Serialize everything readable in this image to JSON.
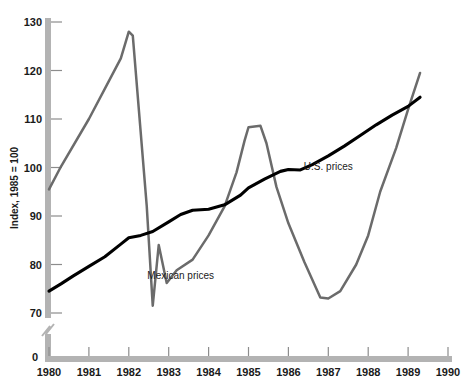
{
  "chart_data": {
    "type": "line",
    "title": "",
    "xlabel": "",
    "ylabel": "Index, 1985 = 100",
    "xlim": [
      1980,
      1990
    ],
    "ylim": [
      70,
      130
    ],
    "yticks": [
      70,
      80,
      90,
      100,
      110,
      120,
      130
    ],
    "xticks": [
      1980,
      1981,
      1982,
      1983,
      1984,
      1985,
      1986,
      1987,
      1988,
      1989,
      1990
    ],
    "origin_label": "0",
    "axis_break": true,
    "grid": false,
    "legend": "inline-annotations",
    "series": [
      {
        "name": "U.S. prices",
        "color": "#000000",
        "label_x": 1987.0,
        "label_y": 99.5,
        "points": [
          [
            1980.0,
            74.5
          ],
          [
            1980.3,
            76.0
          ],
          [
            1980.6,
            77.6
          ],
          [
            1981.0,
            79.6
          ],
          [
            1981.4,
            81.6
          ],
          [
            1981.8,
            84.2
          ],
          [
            1982.0,
            85.5
          ],
          [
            1982.3,
            86.0
          ],
          [
            1982.6,
            86.8
          ],
          [
            1983.0,
            88.8
          ],
          [
            1983.3,
            90.3
          ],
          [
            1983.6,
            91.2
          ],
          [
            1984.0,
            91.4
          ],
          [
            1984.4,
            92.3
          ],
          [
            1984.8,
            94.3
          ],
          [
            1985.0,
            95.8
          ],
          [
            1985.4,
            97.6
          ],
          [
            1985.8,
            99.2
          ],
          [
            1986.0,
            99.6
          ],
          [
            1986.3,
            99.5
          ],
          [
            1986.6,
            100.6
          ],
          [
            1987.0,
            102.4
          ],
          [
            1987.4,
            104.4
          ],
          [
            1987.8,
            106.6
          ],
          [
            1988.2,
            108.8
          ],
          [
            1988.6,
            110.8
          ],
          [
            1989.0,
            112.6
          ],
          [
            1989.3,
            114.5
          ]
        ]
      },
      {
        "name": "Mexican prices",
        "color": "#6b6b6b",
        "label_x": 1983.3,
        "label_y": 77.0,
        "points": [
          [
            1980.0,
            95.5
          ],
          [
            1980.3,
            100.2
          ],
          [
            1981.0,
            110.0
          ],
          [
            1981.5,
            117.8
          ],
          [
            1981.8,
            122.5
          ],
          [
            1982.0,
            128.0
          ],
          [
            1982.1,
            127.2
          ],
          [
            1982.45,
            92.0
          ],
          [
            1982.6,
            71.5
          ],
          [
            1982.75,
            84.0
          ],
          [
            1982.95,
            76.2
          ],
          [
            1983.2,
            78.8
          ],
          [
            1983.6,
            81.0
          ],
          [
            1984.0,
            86.0
          ],
          [
            1984.4,
            92.0
          ],
          [
            1984.7,
            99.0
          ],
          [
            1984.9,
            105.5
          ],
          [
            1985.0,
            108.3
          ],
          [
            1985.3,
            108.6
          ],
          [
            1985.45,
            105.0
          ],
          [
            1985.7,
            96.0
          ],
          [
            1986.0,
            88.5
          ],
          [
            1986.4,
            80.5
          ],
          [
            1986.8,
            73.2
          ],
          [
            1987.0,
            73.0
          ],
          [
            1987.3,
            74.5
          ],
          [
            1987.7,
            80.0
          ],
          [
            1988.0,
            86.0
          ],
          [
            1988.3,
            95.0
          ],
          [
            1988.7,
            104.0
          ],
          [
            1989.0,
            112.0
          ],
          [
            1989.3,
            119.5
          ]
        ]
      }
    ]
  }
}
